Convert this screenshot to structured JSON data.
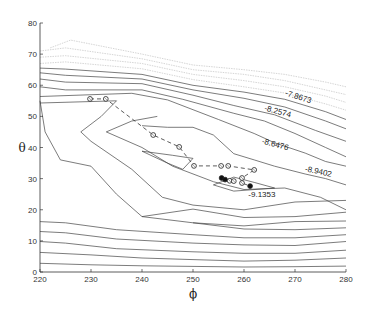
{
  "chart_data": {
    "type": "contour",
    "title": "",
    "xlabel": "ϕ",
    "ylabel": "θ",
    "xlim": [
      220,
      280
    ],
    "ylim": [
      0,
      80
    ],
    "xticks": [
      220,
      230,
      240,
      250,
      260,
      270,
      280
    ],
    "yticks": [
      0,
      10,
      20,
      30,
      40,
      50,
      60,
      70,
      80
    ],
    "grid": false,
    "contour_labels": [
      {
        "text": "-7.8673",
        "x": 270.5,
        "y": 55.5,
        "rotation_deg": 18
      },
      {
        "text": "-8.2574",
        "x": 266.5,
        "y": 50.8,
        "rotation_deg": 15
      },
      {
        "text": "-8.6476",
        "x": 266,
        "y": 40.2,
        "rotation_deg": 15
      },
      {
        "text": "-8.9402",
        "x": 274.5,
        "y": 31.5,
        "rotation_deg": 12
      },
      {
        "text": "-9.1353",
        "x": 263.5,
        "y": 24.0,
        "rotation_deg": 0
      }
    ],
    "contours": [
      {
        "level": "c1",
        "style": "solid",
        "points": [
          [
            220,
            2.8
          ],
          [
            230,
            2.3
          ],
          [
            240,
            2.0
          ],
          [
            250,
            1.8
          ],
          [
            260,
            1.6
          ],
          [
            270,
            1.7
          ],
          [
            280,
            1.9
          ]
        ]
      },
      {
        "level": "c2",
        "style": "solid",
        "points": [
          [
            220,
            6.3
          ],
          [
            230,
            5.5
          ],
          [
            240,
            4.5
          ],
          [
            250,
            4.0
          ],
          [
            260,
            3.5
          ],
          [
            270,
            3.8
          ],
          [
            280,
            4.5
          ]
        ]
      },
      {
        "level": "c3",
        "style": "solid",
        "points": [
          [
            220,
            9.8
          ],
          [
            225,
            9.3
          ],
          [
            235,
            7.5
          ],
          [
            250,
            6.5
          ],
          [
            260,
            6.0
          ],
          [
            270,
            6.0
          ],
          [
            280,
            7.0
          ]
        ]
      },
      {
        "level": "c4",
        "style": "solid",
        "points": [
          [
            220,
            13.0
          ],
          [
            225,
            12.6
          ],
          [
            235,
            10.6
          ],
          [
            250,
            9.3
          ],
          [
            260,
            8.7
          ],
          [
            270,
            8.5
          ],
          [
            280,
            9.8
          ]
        ]
      },
      {
        "level": "c5",
        "style": "solid",
        "points": [
          [
            220,
            16.2
          ],
          [
            225,
            15.8
          ],
          [
            235,
            13.6
          ],
          [
            250,
            12.0
          ],
          [
            260,
            11.0
          ],
          [
            270,
            11.0
          ],
          [
            280,
            12.0
          ]
        ]
      },
      {
        "level": "c6",
        "style": "solid",
        "points": [
          [
            250,
            15.8
          ],
          [
            260,
            13.8
          ],
          [
            270,
            13.6
          ],
          [
            280,
            14.2
          ]
        ]
      },
      {
        "level": "c7",
        "style": "solid",
        "points": [
          [
            240,
            17.8
          ],
          [
            250,
            15.8
          ],
          [
            260,
            14.8
          ],
          [
            270,
            16.2
          ],
          [
            280,
            16.4
          ]
        ]
      },
      {
        "level": "c8",
        "style": "solid",
        "points": [
          [
            220,
            55.0
          ],
          [
            221,
            45.0
          ],
          [
            224,
            36.0
          ],
          [
            230,
            34.0
          ],
          [
            235,
            25.0
          ],
          [
            240,
            17.8
          ],
          [
            250,
            20.2
          ],
          [
            260,
            17.5
          ],
          [
            270,
            17.8
          ],
          [
            280,
            19.2
          ]
        ]
      },
      {
        "level": "c9",
        "style": "solid",
        "points": [
          [
            220,
            54.3
          ],
          [
            235,
            55.0
          ],
          [
            232,
            50.0
          ],
          [
            228,
            45.0
          ],
          [
            230,
            42.0
          ],
          [
            238,
            33.0
          ],
          [
            244,
            24.0
          ],
          [
            250,
            21.5
          ],
          [
            260,
            20.0
          ],
          [
            270,
            22.5
          ],
          [
            280,
            23.0
          ]
        ]
      },
      {
        "level": "c10",
        "style": "solid",
        "points": [
          [
            243,
            50.0
          ],
          [
            238,
            48.5
          ],
          [
            233,
            45.0
          ],
          [
            240,
            40.0
          ],
          [
            246,
            34.0
          ],
          [
            254,
            29.0
          ],
          [
            260,
            26.5
          ],
          [
            268,
            27.0
          ],
          [
            275,
            24.0
          ],
          [
            280,
            20.0
          ]
        ]
      },
      {
        "level": "c11",
        "style": "solid",
        "points": [
          [
            240,
            47.0
          ],
          [
            245,
            46.5
          ],
          [
            250,
            46.5
          ],
          [
            254,
            44.0
          ],
          [
            258,
            38.0
          ],
          [
            262,
            36.0
          ],
          [
            266,
            34.0
          ],
          [
            272,
            31.5
          ],
          [
            276,
            30.0
          ],
          [
            280,
            28.0
          ]
        ]
      },
      {
        "level": "c12",
        "style": "solid",
        "points": [
          [
            220,
            56.4
          ],
          [
            238,
            57.4
          ],
          [
            245,
            55.3
          ],
          [
            255,
            49.0
          ],
          [
            262,
            44.5
          ],
          [
            266,
            41.5
          ],
          [
            272,
            38.2
          ],
          [
            276,
            35.5
          ],
          [
            280,
            34.0
          ]
        ]
      },
      {
        "level": "c13",
        "style": "solid",
        "points": [
          [
            220,
            59.5
          ],
          [
            225,
            58.5
          ],
          [
            240,
            58.5
          ],
          [
            248,
            55.5
          ],
          [
            258,
            51.0
          ],
          [
            264,
            48.5
          ],
          [
            270,
            44.5
          ],
          [
            276,
            40.0
          ],
          [
            280,
            37.0
          ]
        ]
      },
      {
        "level": "c14",
        "style": "solid",
        "points": [
          [
            220,
            62.0
          ],
          [
            225,
            61.0
          ],
          [
            240,
            60.5
          ],
          [
            250,
            56.8
          ],
          [
            258,
            53.5
          ],
          [
            266,
            50.5
          ],
          [
            274,
            45.5
          ],
          [
            280,
            42.0
          ]
        ]
      },
      {
        "level": "c15",
        "style": "solid",
        "points": [
          [
            220,
            64.0
          ],
          [
            225,
            63.2
          ],
          [
            240,
            62.0
          ],
          [
            250,
            58.5
          ],
          [
            260,
            55.8
          ],
          [
            268,
            53.0
          ],
          [
            276,
            48.5
          ],
          [
            280,
            46.0
          ]
        ]
      },
      {
        "level": "c16",
        "style": "solid",
        "points": [
          [
            220,
            65.5
          ],
          [
            225,
            65.2
          ],
          [
            240,
            63.5
          ],
          [
            250,
            60.0
          ],
          [
            260,
            57.8
          ],
          [
            268,
            55.5
          ],
          [
            276,
            51.5
          ],
          [
            280,
            49.0
          ]
        ]
      },
      {
        "level": "c17",
        "style": "faint",
        "points": [
          [
            220,
            67.0
          ],
          [
            225,
            67.5
          ],
          [
            240,
            65.3
          ],
          [
            250,
            61.8
          ],
          [
            260,
            59.5
          ],
          [
            268,
            57.5
          ],
          [
            276,
            54.0
          ],
          [
            280,
            52.0
          ]
        ]
      },
      {
        "level": "c18",
        "style": "faint",
        "points": [
          [
            220,
            69.0
          ],
          [
            225,
            69.5
          ],
          [
            240,
            67.0
          ],
          [
            250,
            63.5
          ],
          [
            260,
            61.5
          ],
          [
            268,
            59.5
          ],
          [
            276,
            56.5
          ],
          [
            280,
            54.5
          ]
        ]
      },
      {
        "level": "c19",
        "style": "faint",
        "points": [
          [
            220,
            71.0
          ],
          [
            225,
            72.0
          ],
          [
            240,
            68.5
          ],
          [
            250,
            65.0
          ],
          [
            260,
            63.5
          ],
          [
            268,
            61.5
          ],
          [
            276,
            58.5
          ],
          [
            280,
            57.0
          ]
        ]
      },
      {
        "level": "c20",
        "style": "faint",
        "points": [
          [
            222,
            72.0
          ],
          [
            226,
            74.5
          ],
          [
            240,
            70.0
          ],
          [
            250,
            66.5
          ],
          [
            260,
            65.0
          ],
          [
            268,
            63.5
          ],
          [
            276,
            61.0
          ],
          [
            280,
            59.5
          ]
        ]
      },
      {
        "level": "c21",
        "style": "solid",
        "points": [
          [
            240,
            38.8
          ],
          [
            246,
            37.5
          ],
          [
            250,
            36.5
          ],
          [
            248,
            33.0
          ],
          [
            245,
            35.0
          ],
          [
            240,
            38.8
          ]
        ]
      },
      {
        "level": "c22",
        "style": "solid",
        "points": [
          [
            254,
            28.0
          ],
          [
            258,
            30.5
          ],
          [
            262,
            28.8
          ],
          [
            266,
            27.0
          ],
          [
            258,
            26.0
          ],
          [
            254,
            28.0
          ]
        ]
      }
    ],
    "path_series": {
      "name": "optimization path",
      "style": "dashed",
      "points": [
        [
          229.8,
          55.6
        ],
        [
          232.9,
          55.6
        ],
        [
          242.2,
          44.0
        ],
        [
          247.3,
          40.2
        ],
        [
          250.2,
          34.1
        ],
        [
          255.5,
          34.1
        ],
        [
          256.9,
          34.1
        ],
        [
          262.0,
          32.8
        ],
        [
          259.6,
          30.2
        ],
        [
          259.6,
          28.6
        ],
        [
          261.2,
          27.6
        ]
      ]
    },
    "markers": [
      {
        "x": 229.8,
        "y": 55.6,
        "filled": false
      },
      {
        "x": 232.9,
        "y": 55.6,
        "filled": false
      },
      {
        "x": 242.2,
        "y": 44.0,
        "filled": false
      },
      {
        "x": 247.3,
        "y": 40.2,
        "filled": false
      },
      {
        "x": 250.2,
        "y": 34.1,
        "filled": false
      },
      {
        "x": 255.5,
        "y": 34.1,
        "filled": false
      },
      {
        "x": 256.9,
        "y": 34.1,
        "filled": false
      },
      {
        "x": 262.0,
        "y": 32.8,
        "filled": false
      },
      {
        "x": 259.6,
        "y": 30.2,
        "filled": false
      },
      {
        "x": 255.6,
        "y": 30.2,
        "filled": true
      },
      {
        "x": 256.3,
        "y": 29.7,
        "filled": true
      },
      {
        "x": 257.2,
        "y": 29.3,
        "filled": false
      },
      {
        "x": 258.0,
        "y": 29.2,
        "filled": false
      },
      {
        "x": 259.6,
        "y": 28.6,
        "filled": false
      },
      {
        "x": 261.2,
        "y": 27.6,
        "filled": true
      }
    ]
  }
}
